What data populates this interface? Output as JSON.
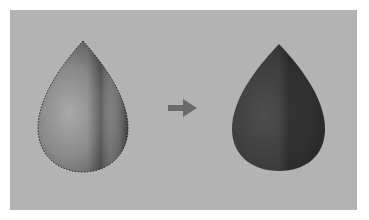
{
  "figure": {
    "colors": {
      "page_background": "#ffffff",
      "panel_background": "#b3b3b3",
      "left_drop_light": "#a8a8a8",
      "left_drop_mid": "#7d7d7d",
      "left_drop_dark": "#4e4e4e",
      "right_drop_light": "#555555",
      "right_drop_mid": "#3c3c3c",
      "right_drop_dark": "#2a2a2a",
      "arrow": "#6a6a6a",
      "selection_outline": "#2e2e2e"
    },
    "left_drop": {
      "label": "selected-gradient-drop"
    },
    "arrow": {
      "label": "right-arrow"
    },
    "right_drop": {
      "label": "filled-dark-drop"
    }
  }
}
